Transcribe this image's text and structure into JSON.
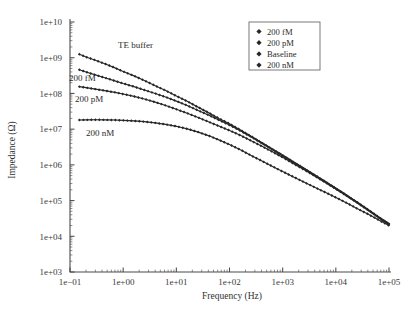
{
  "chart_data": {
    "type": "line",
    "title": "",
    "xlabel": "Frequency (Hz)",
    "ylabel": "Impedance (Ω)",
    "xscale": "log",
    "yscale": "log",
    "xlim": [
      0.1,
      100000
    ],
    "ylim": [
      1000,
      10000000000
    ],
    "xticklabels": [
      "1e−01",
      "1e+00",
      "1e+01",
      "1e+02",
      "1e+03",
      "1e+04",
      "1e+05"
    ],
    "yticklabels": [
      "1e+03",
      "1e+04",
      "1e+05",
      "1e+06",
      "1e+07",
      "1e+08",
      "1e+09",
      "1e+10"
    ],
    "grid": false,
    "legend_position": "top-right",
    "legend_entries": [
      "200 fM",
      "200 pM",
      "Baseline",
      "200 nM"
    ],
    "marker": "diamond",
    "series": [
      {
        "name": "Baseline",
        "inline_label": "TE buffer",
        "x": [
          0.15,
          0.2,
          0.3,
          0.45,
          0.7,
          1.0,
          1.6,
          2.5,
          4.0,
          6.3,
          10,
          16,
          25,
          40,
          63,
          100,
          160,
          250,
          400,
          630,
          1000,
          1600,
          2500,
          4000,
          6300,
          10000,
          16000,
          25000,
          40000,
          63000,
          100000
        ],
        "y": [
          1250000000.0,
          1050000000.0,
          850000000.0,
          680000000.0,
          520000000.0,
          410000000.0,
          310000000.0,
          230000000.0,
          165000000.0,
          120000000.0,
          85000000.0,
          60000000.0,
          42000000.0,
          29000000.0,
          20000000.0,
          14200000.0,
          9500000.0,
          6400000.0,
          4200000.0,
          2800000.0,
          1850000.0,
          1200000.0,
          800000.0,
          520000.0,
          340000.0,
          220000.0,
          140000.0,
          90000.0,
          56000.0,
          35000.0,
          22000.0
        ]
      },
      {
        "name": "200 fM",
        "inline_label": "200 fM",
        "x": [
          0.15,
          0.2,
          0.3,
          0.45,
          0.7,
          1.0,
          1.6,
          2.5,
          4.0,
          6.3,
          10,
          16,
          25,
          40,
          63,
          100,
          160,
          250,
          400,
          630,
          1000,
          1600,
          2500,
          4000,
          6300,
          10000,
          16000,
          25000,
          40000,
          63000,
          100000
        ],
        "y": [
          460000000.0,
          400000000.0,
          330000000.0,
          275000000.0,
          225000000.0,
          190000000.0,
          155000000.0,
          125000000.0,
          100000000.0,
          79000000.0,
          61000000.0,
          46000000.0,
          34000000.0,
          25000000.0,
          18000000.0,
          13000000.0,
          9000000.0,
          6200000.0,
          4100000.0,
          2750000.0,
          1820000.0,
          1180000.0,
          790000.0,
          510000.0,
          335000.0,
          218000.0,
          138000.0,
          89000.0,
          55000.0,
          34500.0,
          22000.0
        ]
      },
      {
        "name": "200 pM",
        "inline_label": "200 pM",
        "x": [
          0.15,
          0.2,
          0.3,
          0.45,
          0.7,
          1.0,
          1.6,
          2.5,
          4.0,
          6.3,
          10,
          16,
          25,
          40,
          63,
          100,
          160,
          250,
          400,
          630,
          1000,
          1600,
          2500,
          4000,
          6300,
          10000,
          16000,
          25000,
          40000,
          63000,
          100000
        ],
        "y": [
          155000000.0,
          145000000.0,
          132000000.0,
          120000000.0,
          107000000.0,
          96000000.0,
          83000000.0,
          70000000.0,
          57000000.0,
          46000000.0,
          36000000.0,
          28000000.0,
          21500000.0,
          16200000.0,
          12200000.0,
          9200000.0,
          6700000.0,
          4800000.0,
          3350000.0,
          2350000.0,
          1620000.0,
          1080000.0,
          740000.0,
          490000.0,
          325000.0,
          212000.0,
          136000.0,
          88000.0,
          55000.0,
          34500.0,
          22000.0
        ]
      },
      {
        "name": "200 nM",
        "inline_label": "200 nM",
        "x": [
          0.15,
          0.2,
          0.3,
          0.45,
          0.7,
          1.0,
          1.6,
          2.5,
          4.0,
          6.3,
          10,
          16,
          25,
          40,
          63,
          100,
          160,
          250,
          400,
          630,
          1000,
          1600,
          2500,
          4000,
          6300,
          10000,
          16000,
          25000,
          40000,
          63000,
          100000
        ],
        "y": [
          18000000.0,
          18200000.0,
          18300000.0,
          18200000.0,
          18000000.0,
          17600000.0,
          17000000.0,
          16200000.0,
          15000000.0,
          13600000.0,
          12000000.0,
          10200000.0,
          8400000.0,
          6600000.0,
          5000000.0,
          3700000.0,
          2650000.0,
          1850000.0,
          1300000.0,
          920000.0,
          650000.0,
          460000.0,
          330000.0,
          235000.0,
          170000.0,
          122000.0,
          86000.0,
          60000.0,
          42000.0,
          29000.0,
          20000.0
        ]
      }
    ]
  },
  "legend": {
    "items": [
      {
        "label": "200 fM"
      },
      {
        "label": "200 pM"
      },
      {
        "label": "Baseline"
      },
      {
        "label": "200 nM"
      }
    ]
  },
  "axes": {
    "x_title": "Frequency (Hz)",
    "y_title": "Impedance (Ω)",
    "x_ticks": [
      "1e−01",
      "1e+00",
      "1e+01",
      "1e+02",
      "1e+03",
      "1e+04",
      "1e+05"
    ],
    "y_ticks": [
      "1e+10",
      "1e+09",
      "1e+08",
      "1e+07",
      "1e+06",
      "1e+05",
      "1e+04",
      "1e+03"
    ]
  },
  "annotations": [
    {
      "text": "TE buffer"
    },
    {
      "text": "200 fM"
    },
    {
      "text": "200 pM"
    },
    {
      "text": "200 nM"
    }
  ],
  "colors": {
    "curve": "#2a2a2a",
    "axis": "#4a4a4a",
    "text": "#2b2b2b",
    "background": "#ffffff"
  }
}
